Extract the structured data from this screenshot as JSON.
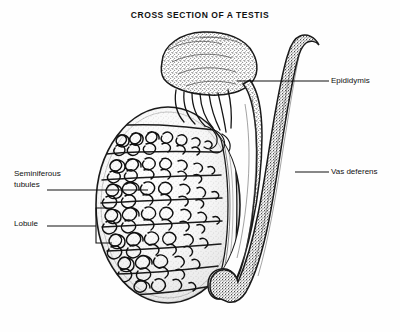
{
  "figure": {
    "title": "CROSS SECTION OF A TESTIS",
    "type": "anatomical-illustration",
    "subject": "testis",
    "style": "black-and-white stipple and line engraving",
    "background_color": "#fefefe",
    "ink_color": "#111111"
  },
  "labels": {
    "epididymis": "Epididymis",
    "vas_deferens": "Vas deferens",
    "seminiferous_line1": "Seminiferous",
    "seminiferous_line2": "tubules",
    "lobule": "Lobule"
  },
  "structures": [
    {
      "name": "testis",
      "description": "large ovoid body occupying the left portion of the figure, sectioned to reveal internal lobules"
    },
    {
      "name": "seminiferous-tubules",
      "description": "densely coiled tubules filling each wedge-shaped lobule"
    },
    {
      "name": "lobule",
      "description": "wedge-shaped compartment of the testis bounded by fibrous septa"
    },
    {
      "name": "septa",
      "description": "fibrous partitions radiating inward toward the mediastinum"
    },
    {
      "name": "rete-testis",
      "description": "vertical network band at the posterior margin where septa converge"
    },
    {
      "name": "efferent-ductules",
      "description": "slender ducts leaving the rete testis and entering the head of the epididymis"
    },
    {
      "name": "epididymis",
      "description": "stippled, lobulated comma-shaped organ capping and descending behind the testis"
    },
    {
      "name": "vas-deferens",
      "description": "long smooth duct ascending from the tail of the epididymis with a hooked upper end"
    }
  ],
  "leaders": {
    "epididymis": "horizontal leader from the epididymis body rightward to the label",
    "vas_deferens": "horizontal leader from the vas deferens rightward to the label",
    "seminiferous_tubules": "horizontal leader from the label rightward into the tubule mass",
    "lobule": "horizontal leader from the label to a rectangular bracket enclosing one lobule"
  }
}
